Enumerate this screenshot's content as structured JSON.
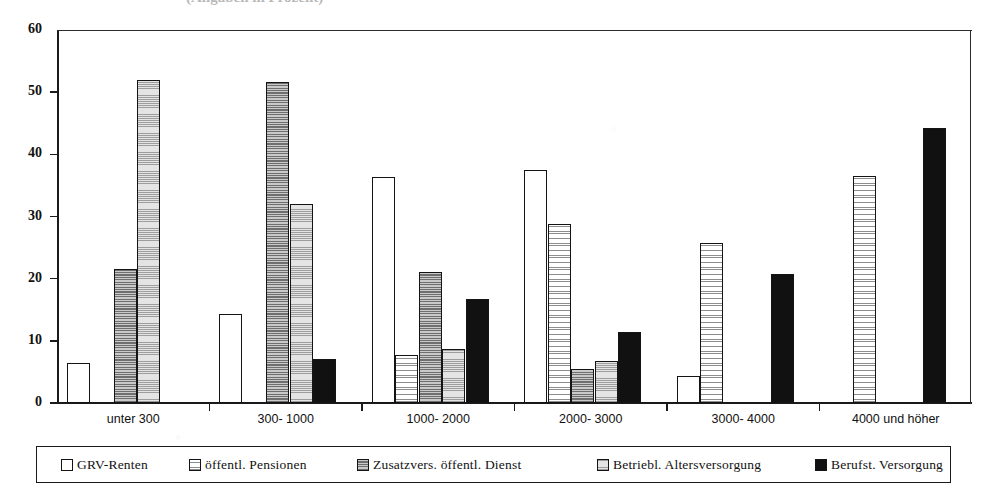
{
  "title": {
    "text": "(Angaben in Prozent)",
    "visible_fragment": true
  },
  "axes": {
    "y": {
      "label": "",
      "ticks": [
        "0",
        "10",
        "20",
        "30",
        "40",
        "50",
        "60"
      ],
      "min": 0,
      "max": 60
    },
    "x": {
      "label": "",
      "categories": [
        "unter 300",
        "300- 1000",
        "1000- 2000",
        "2000- 3000",
        "3000- 4000",
        "4000 und höher"
      ]
    }
  },
  "legend": {
    "items": [
      {
        "label": "GRV-Renten",
        "swatch": "white",
        "color": "#ffffff"
      },
      {
        "label": "öffentl. Pensionen",
        "swatch": "grid",
        "color": "#f2f2f2"
      },
      {
        "label": "Zusatzvers. öffentl. Dienst",
        "swatch": "mid",
        "color": "#9a9a9a"
      },
      {
        "label": "Betriebl. Altersversorgung",
        "swatch": "light",
        "color": "#d6d6d6"
      },
      {
        "label": "Berufst. Versorgung",
        "swatch": "black",
        "color": "#111111"
      }
    ]
  },
  "chart_data": {
    "type": "bar",
    "title": "(Angaben in Prozent)",
    "xlabel": "",
    "ylabel": "",
    "ylim": [
      0,
      60
    ],
    "grid": false,
    "legend_position": "bottom",
    "categories": [
      "unter 300",
      "300- 1000",
      "1000- 2000",
      "2000- 3000",
      "3000- 4000",
      "4000 und höher"
    ],
    "series": [
      {
        "name": "GRV-Renten",
        "fill": "white",
        "values": [
          6.4,
          14.3,
          36.4,
          37.5,
          4.3,
          0
        ]
      },
      {
        "name": "öffentl. Pensionen",
        "fill": "grid",
        "values": [
          0,
          0,
          7.8,
          28.8,
          25.8,
          36.5
        ]
      },
      {
        "name": "Zusatzvers. öffentl. Dienst",
        "fill": "mid",
        "values": [
          21.5,
          51.6,
          21.0,
          5.5,
          0,
          0
        ]
      },
      {
        "name": "Betriebl. Altersversorgung",
        "fill": "light",
        "values": [
          52.0,
          32.0,
          8.7,
          6.8,
          0,
          0
        ]
      },
      {
        "name": "Berufst. Versorgung",
        "fill": "black",
        "values": [
          0,
          7.0,
          16.7,
          11.5,
          20.7,
          44.2
        ]
      }
    ]
  }
}
